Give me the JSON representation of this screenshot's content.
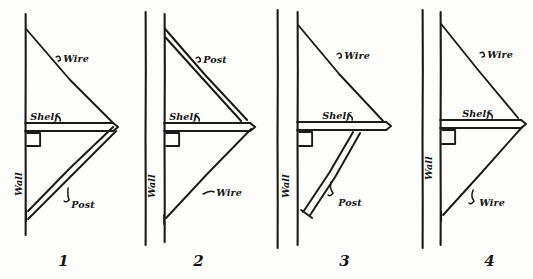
{
  "document": {
    "kind": "hand-drawn-engineering-diagram",
    "title": "Shelf bracket support arrangements",
    "background_color": "#fdfdfc",
    "ink_color": "#1a1a1a",
    "figure_count": 4
  },
  "figures": [
    {
      "number": "1",
      "caption": "1",
      "wall_style": "single-line",
      "labels": {
        "wire": "Wire",
        "shelf": "Shelf",
        "wall": "Wall",
        "post": "Post"
      },
      "members": {
        "upper": "wire",
        "lower": "post"
      },
      "upper_label": "Wire",
      "lower_label": "Post"
    },
    {
      "number": "2",
      "caption": "2",
      "wall_style": "double-line",
      "labels": {
        "post": "Post",
        "shelf": "Shelf",
        "wall": "Wall",
        "wire": "Wire"
      },
      "members": {
        "upper": "post",
        "lower": "wire"
      },
      "upper_label": "Post",
      "lower_label": "Wire"
    },
    {
      "number": "3",
      "caption": "3",
      "wall_style": "double-line",
      "labels": {
        "wire": "Wire",
        "shelf": "Shelf",
        "wall": "Wall",
        "post": "Post"
      },
      "members": {
        "upper": "wire",
        "lower": "post"
      },
      "upper_label": "Wire",
      "lower_label": "Post"
    },
    {
      "number": "4",
      "caption": "4",
      "wall_style": "double-line",
      "labels": {
        "wire_upper": "Wire",
        "shelf": "Shelf",
        "wall": "Wall",
        "wire_lower": "Wire"
      },
      "members": {
        "upper": "wire",
        "lower": "wire"
      },
      "upper_label": "Wire",
      "lower_label": "Wire"
    }
  ]
}
